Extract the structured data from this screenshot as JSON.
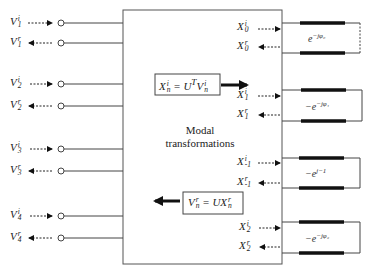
{
  "diagram": {
    "type": "block-diagram",
    "center_block": {
      "label_line1": "Modal",
      "label_line2": "transformations"
    },
    "forward_equation": {
      "lhs": "X",
      "lhs_sup": "i",
      "lhs_sub": "n",
      "op": "= U",
      "op_sup": "T",
      "rhs": "V",
      "rhs_sup": "i",
      "rhs_sub": "n"
    },
    "backward_equation": {
      "lhs": "V",
      "lhs_sup": "r",
      "lhs_sub": "n",
      "op": "= UX",
      "rhs_sup": "r",
      "rhs_sub": "n"
    },
    "left_ports": [
      {
        "name": "V",
        "sup": "i",
        "sub": "1",
        "direction": "in"
      },
      {
        "name": "V",
        "sup": "r",
        "sub": "1",
        "direction": "out"
      },
      {
        "name": "V",
        "sup": "i",
        "sub": "2",
        "direction": "in"
      },
      {
        "name": "V",
        "sup": "r",
        "sub": "2",
        "direction": "out"
      },
      {
        "name": "V",
        "sup": "i",
        "sub": "3",
        "direction": "in"
      },
      {
        "name": "V",
        "sup": "r",
        "sub": "3",
        "direction": "out"
      },
      {
        "name": "V",
        "sup": "i",
        "sub": "4",
        "direction": "in"
      },
      {
        "name": "V",
        "sup": "r",
        "sub": "4",
        "direction": "out"
      }
    ],
    "right_ports": [
      {
        "name": "X",
        "sup": "i",
        "sub": "0",
        "direction": "out"
      },
      {
        "name": "X",
        "sup": "r",
        "sub": "0",
        "direction": "in"
      },
      {
        "name": "X",
        "sup": "i",
        "sub": "1",
        "direction": "out"
      },
      {
        "name": "X",
        "sup": "r",
        "sub": "1",
        "direction": "in"
      },
      {
        "name": "X",
        "sup": "i",
        "sub": "-1",
        "direction": "out"
      },
      {
        "name": "X",
        "sup": "r",
        "sub": "-1",
        "direction": "in"
      },
      {
        "name": "X",
        "sup": "i",
        "sub": "2",
        "direction": "out"
      },
      {
        "name": "X",
        "sup": "r",
        "sub": "2",
        "direction": "in"
      }
    ],
    "mode_loops": [
      {
        "sign": "",
        "base": "e",
        "exponent": "−jφ₀",
        "closure": "dashed"
      },
      {
        "sign": "−",
        "base": "e",
        "exponent": "−jφ₁",
        "closure": "solid"
      },
      {
        "sign": "−",
        "base": "e",
        "exponent": "j−1",
        "closure": "solid"
      },
      {
        "sign": "−",
        "base": "e",
        "exponent": "−jφ₂",
        "closure": "solid"
      }
    ]
  }
}
